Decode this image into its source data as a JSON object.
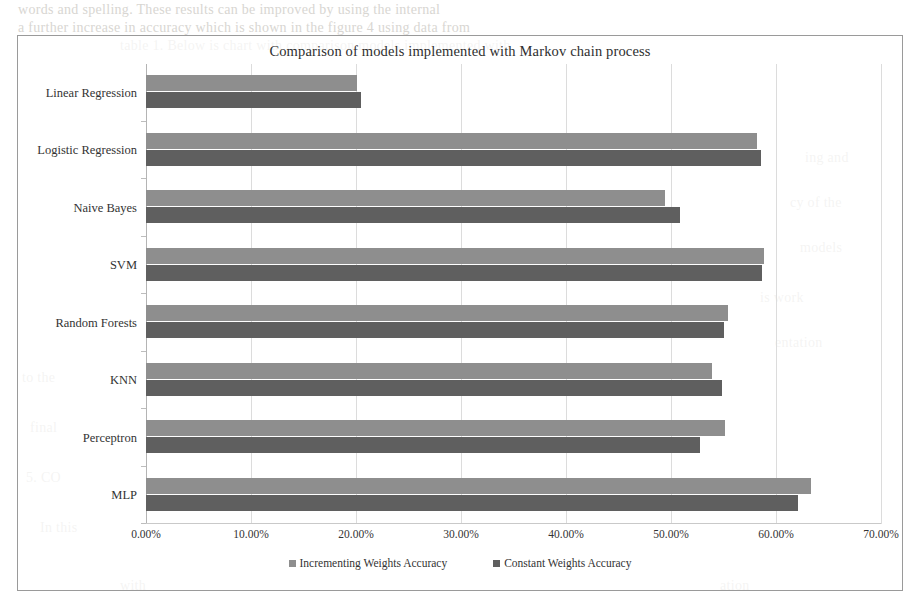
{
  "chart_data": {
    "type": "bar",
    "orientation": "horizontal",
    "title": "Comparison of models implemented with Markov chain process",
    "xlabel": "",
    "ylabel": "",
    "xlim": [
      0,
      70
    ],
    "x_tick_labels": [
      "0.00%",
      "10.00%",
      "20.00%",
      "30.00%",
      "40.00%",
      "50.00%",
      "60.00%",
      "70.00%"
    ],
    "x_tick_values": [
      0,
      10,
      20,
      30,
      40,
      50,
      60,
      70
    ],
    "value_suffix": "%",
    "grid": true,
    "grid_axis": "x",
    "legend_position": "bottom",
    "categories": [
      "Linear Regression",
      "Logistic Regression",
      "Naive Bayes",
      "SVM",
      "Random Forests",
      "KNN",
      "Perceptron",
      "MLP"
    ],
    "series": [
      {
        "name": "Incrementing Weights Accuracy",
        "color": "#8e8e8e",
        "values": [
          20.1,
          58.2,
          49.4,
          58.9,
          55.4,
          53.9,
          55.1,
          63.3
        ]
      },
      {
        "name": "Constant Weights Accuracy",
        "color": "#5f5f5f",
        "values": [
          20.5,
          58.6,
          50.9,
          58.7,
          55.0,
          54.9,
          52.8,
          62.1
        ]
      }
    ]
  },
  "background_text": {
    "top_line_1": "words and spelling. These results can be improved by using the internal",
    "top_line_2": "a further increase in accuracy which is shown in the figure 4 using data from",
    "top_line_3": "table 1. Below is chart with comparison models implemented with",
    "right_1": "ing and",
    "right_2": "cy of the",
    "right_3": "models",
    "right_4": "is work",
    "right_5": "entation",
    "left_1": "to the",
    "left_2": "final",
    "left_3": "5. CO",
    "left_4": "In this",
    "center_1": "with",
    "center_2": "ation"
  }
}
